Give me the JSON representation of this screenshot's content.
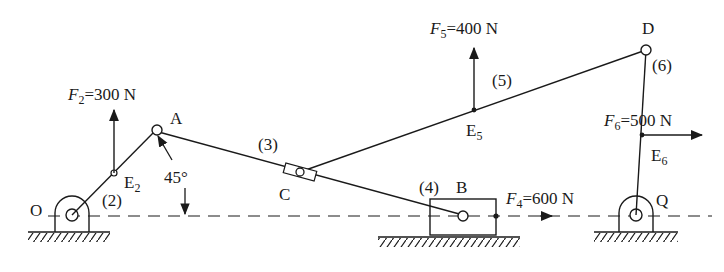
{
  "diagram": {
    "type": "planar-linkage-static-force-analysis",
    "points": {
      "O": {
        "label": "O"
      },
      "A": {
        "label": "A"
      },
      "B": {
        "label": "B"
      },
      "C": {
        "label": "C"
      },
      "D": {
        "label": "D"
      },
      "Q": {
        "label": "Q"
      },
      "E2": {
        "label": "E",
        "sub": "2"
      },
      "E5": {
        "label": "E",
        "sub": "5"
      },
      "E6": {
        "label": "E",
        "sub": "6"
      }
    },
    "links": {
      "l2": "(2)",
      "l3": "(3)",
      "l4": "(4)",
      "l5": "(5)",
      "l6": "(6)"
    },
    "angle": "45°",
    "forces": {
      "F2": {
        "sym": "F",
        "sub": "2",
        "value": "=300 N"
      },
      "F4": {
        "sym": "F",
        "sub": "4",
        "value": "=600 N"
      },
      "F5": {
        "sym": "F",
        "sub": "5",
        "value": "=400 N"
      },
      "F6": {
        "sym": "F",
        "sub": "6",
        "value": "=500 N"
      }
    },
    "colors": {
      "ink": "#1a1a1a",
      "background": "#ffffff"
    }
  }
}
